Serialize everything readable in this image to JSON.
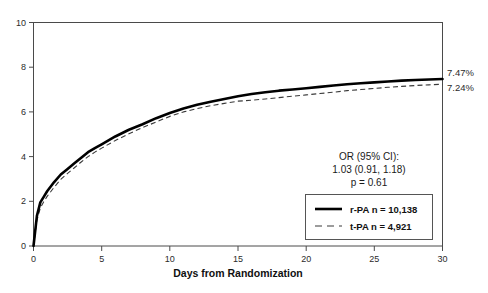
{
  "chart_data": {
    "type": "line",
    "title": "",
    "subtitle": "",
    "xlabel": "Days from Randomization",
    "ylabel": "",
    "xlim": [
      0,
      30
    ],
    "ylim": [
      0,
      10
    ],
    "xticks": [
      0,
      5,
      10,
      15,
      20,
      25,
      30
    ],
    "xtick_labels": [
      "0",
      "5",
      "10",
      "15",
      "20",
      "25",
      "30"
    ],
    "yticks": [
      0,
      2,
      4,
      6,
      8,
      10
    ],
    "ytick_labels": [
      "0",
      "2",
      "4",
      "6",
      "8",
      "10"
    ],
    "grid": false,
    "legend_position": "lower-right",
    "series": [
      {
        "name": "r-PA",
        "legend_label": "r-PA  n = 10,138",
        "n": "10,138",
        "style": "solid-bold",
        "color": "#000000",
        "end_label": "7.47%",
        "x": [
          0,
          0.25,
          0.5,
          0.75,
          1,
          1.5,
          2,
          2.5,
          3,
          3.5,
          4,
          4.5,
          5,
          6,
          7,
          8,
          9,
          10,
          11,
          12,
          13,
          14,
          15,
          16,
          17,
          18,
          19,
          20,
          21,
          22,
          23,
          24,
          25,
          26,
          27,
          28,
          29,
          30
        ],
        "y": [
          0,
          1.35,
          1.95,
          2.2,
          2.45,
          2.85,
          3.2,
          3.45,
          3.7,
          3.95,
          4.2,
          4.38,
          4.55,
          4.9,
          5.2,
          5.45,
          5.72,
          5.95,
          6.15,
          6.32,
          6.45,
          6.58,
          6.7,
          6.8,
          6.88,
          6.95,
          7.0,
          7.06,
          7.12,
          7.18,
          7.24,
          7.28,
          7.32,
          7.36,
          7.4,
          7.43,
          7.45,
          7.47
        ]
      },
      {
        "name": "t-PA",
        "legend_label": "t-PA  n = 4,921",
        "n": "4,921",
        "style": "dashed",
        "color": "#3a3a3a",
        "end_label": "7.24%",
        "x": [
          0,
          0.25,
          0.5,
          0.75,
          1,
          1.5,
          2,
          2.5,
          3,
          3.5,
          4,
          4.5,
          5,
          6,
          7,
          8,
          9,
          10,
          11,
          12,
          13,
          14,
          15,
          16,
          17,
          18,
          19,
          20,
          21,
          22,
          23,
          24,
          25,
          26,
          27,
          28,
          29,
          30
        ],
        "y": [
          0,
          1.15,
          1.7,
          1.98,
          2.22,
          2.62,
          2.98,
          3.25,
          3.5,
          3.76,
          4.0,
          4.2,
          4.38,
          4.72,
          5.02,
          5.3,
          5.55,
          5.8,
          6.0,
          6.15,
          6.28,
          6.38,
          6.48,
          6.52,
          6.58,
          6.64,
          6.7,
          6.76,
          6.82,
          6.88,
          6.95,
          7.0,
          7.05,
          7.1,
          7.14,
          7.18,
          7.21,
          7.24
        ]
      }
    ],
    "annotations": {
      "or_line1": "OR (95% CI):",
      "or_line2": "1.03 (0.91, 1.18)",
      "or_line3": "p = 0.61"
    }
  },
  "axis": {
    "x_title": "Days from Randomization"
  },
  "colors": {
    "background": "#ffffff",
    "frame": "#4a4a4a",
    "text": "#1a1a1a",
    "series_primary": "#000000",
    "series_secondary": "#3a3a3a"
  }
}
